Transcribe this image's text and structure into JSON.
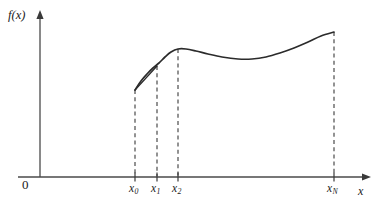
{
  "figure": {
    "title": "",
    "axis_labels": {
      "y": "f(x)",
      "x": "x",
      "origin": "0"
    },
    "tick_labels": [
      {
        "id": "x0",
        "text": "x",
        "subscript": "0",
        "x": 135
      },
      {
        "id": "x1",
        "text": "x",
        "subscript": "1",
        "x": 157
      },
      {
        "id": "x2",
        "text": "x",
        "subscript": "2",
        "x": 178
      },
      {
        "id": "xN",
        "text": "x",
        "subscript": "N",
        "x": 334
      }
    ],
    "colors": {
      "curve": "#2b2b2b",
      "chord": "#2b2b2b",
      "axis": "#4a4a4a",
      "dashed": "#3a3a3a",
      "background": "#ffffff"
    }
  },
  "chart_data": {
    "type": "line",
    "title": "",
    "xlabel": "x",
    "ylabel": "f(x)",
    "grid": false,
    "legend": false,
    "axis": {
      "y_axis_x_px": 40,
      "y_axis_top_px": 12,
      "x_axis_y_px": 177,
      "x_axis_right_px": 371
    },
    "x_nodes": [
      {
        "label": "x0",
        "px": 135,
        "f_px": 90
      },
      {
        "label": "x1",
        "px": 157,
        "f_px": 66
      },
      {
        "label": "x2",
        "px": 178,
        "f_px": 49
      },
      {
        "label": "xN",
        "px": 334,
        "f_px": 32
      }
    ],
    "series": [
      {
        "name": "f(x)",
        "style": "solid-curve",
        "points_px": [
          [
            135,
            90
          ],
          [
            141,
            81
          ],
          [
            147,
            74
          ],
          [
            153,
            68
          ],
          [
            159,
            63
          ],
          [
            165,
            57
          ],
          [
            171,
            52
          ],
          [
            178,
            49
          ],
          [
            186,
            49
          ],
          [
            196,
            51
          ],
          [
            208,
            54
          ],
          [
            222,
            57
          ],
          [
            238,
            59
          ],
          [
            252,
            59
          ],
          [
            266,
            57
          ],
          [
            280,
            53
          ],
          [
            294,
            48
          ],
          [
            308,
            42
          ],
          [
            321,
            36
          ],
          [
            334,
            32
          ]
        ]
      },
      {
        "name": "chord-x0-x1",
        "style": "solid-straight",
        "points_px": [
          [
            135,
            90
          ],
          [
            157,
            66
          ]
        ]
      }
    ],
    "dashed_drop_lines": [
      {
        "label": "x0",
        "x_px": 135,
        "y_top_px": 90,
        "y_bottom_px": 177
      },
      {
        "label": "x1",
        "x_px": 157,
        "y_top_px": 66,
        "y_bottom_px": 177
      },
      {
        "label": "x2",
        "x_px": 178,
        "y_top_px": 49,
        "y_bottom_px": 177
      },
      {
        "label": "xN",
        "x_px": 334,
        "y_top_px": 32,
        "y_bottom_px": 177
      }
    ],
    "ticks_px": [
      135,
      157,
      178,
      334
    ]
  }
}
